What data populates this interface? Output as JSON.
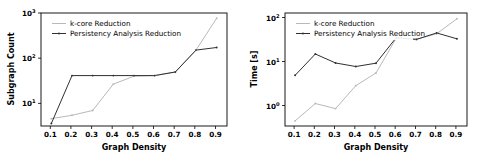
{
  "figure": {
    "panel_count": 2,
    "background": "#ffffff",
    "colors": {
      "kcore": "#b9b9b9",
      "persistency": "#303030",
      "axis": "#000000"
    }
  },
  "chart_data": [
    {
      "id": "subgraph-count-chart",
      "type": "line",
      "title": "",
      "xlabel": "Graph Density",
      "ylabel": "Subgraph Count",
      "yscale": "log",
      "xscale": "linear",
      "xlim": [
        0.05,
        0.95
      ],
      "ylim": [
        2,
        1000
      ],
      "grid": false,
      "legend_position": "upper left",
      "x": [
        0.1,
        0.2,
        0.3,
        0.4,
        0.5,
        0.6,
        0.7,
        0.8,
        0.9
      ],
      "xticks": [
        "0.1",
        "0.2",
        "0.3",
        "0.4",
        "0.5",
        "0.6",
        "0.7",
        "0.8",
        "0.9"
      ],
      "yticks": [
        "10^1",
        "10^2",
        "10^3"
      ],
      "ytick_values": [
        10,
        100,
        1000
      ],
      "series": [
        {
          "name": "k-core Reduction",
          "color": "#b9b9b9",
          "marker": "point",
          "values": [
            3.0,
            3.6,
            4.7,
            20.0,
            31.0,
            32.0,
            39.0,
            130.0,
            750.0
          ]
        },
        {
          "name": "Persistency Analysis Reduction",
          "color": "#303030",
          "marker": "point",
          "values": [
            2.3,
            32.0,
            32.0,
            32.0,
            32.0,
            32.0,
            39.0,
            130.0,
            150.0
          ]
        }
      ]
    },
    {
      "id": "runtime-chart",
      "type": "line",
      "title": "",
      "xlabel": "Graph Density",
      "ylabel": "Time [s]",
      "yscale": "log",
      "xscale": "linear",
      "xlim": [
        0.05,
        0.95
      ],
      "ylim": [
        0.28,
        130
      ],
      "grid": false,
      "legend_position": "upper left",
      "x": [
        0.1,
        0.2,
        0.3,
        0.4,
        0.5,
        0.6,
        0.7,
        0.8,
        0.9
      ],
      "xticks": [
        "0.1",
        "0.2",
        "0.3",
        "0.4",
        "0.5",
        "0.6",
        "0.7",
        "0.8",
        "0.9"
      ],
      "yticks": [
        "10^0",
        "10^1",
        "10^2"
      ],
      "ytick_values": [
        1,
        10,
        100
      ],
      "series": [
        {
          "name": "k-core Reduction",
          "color": "#b9b9b9",
          "marker": "point",
          "values": [
            0.37,
            0.95,
            0.72,
            2.5,
            5.0,
            33.0,
            31.0,
            42.0,
            95.0
          ]
        },
        {
          "name": "Persistency Analysis Reduction",
          "color": "#303030",
          "marker": "point",
          "values": [
            4.4,
            14.0,
            8.6,
            7.1,
            8.5,
            34.0,
            31.0,
            44.0,
            32.0
          ]
        }
      ]
    }
  ],
  "legend": {
    "entries": [
      {
        "label": "k-core Reduction",
        "color": "#b9b9b9"
      },
      {
        "label": "Persistency Analysis Reduction",
        "color": "#303030"
      }
    ]
  },
  "labels": {
    "x_axis": "Graph Density",
    "y_axis_left": "Subgraph Count",
    "y_axis_right": "Time [s]",
    "series_kcore": "k-core Reduction",
    "series_persistency": "Persistency Analysis Reduction",
    "exp_base": "10",
    "left_exp_1": "1",
    "left_exp_2": "2",
    "left_exp_3": "3",
    "right_exp_0": "0",
    "right_exp_1": "1",
    "right_exp_2": "2",
    "tick_01": "0.1",
    "tick_02": "0.2",
    "tick_03": "0.3",
    "tick_04": "0.4",
    "tick_05": "0.5",
    "tick_06": "0.6",
    "tick_07": "0.7",
    "tick_08": "0.8",
    "tick_09": "0.9"
  }
}
